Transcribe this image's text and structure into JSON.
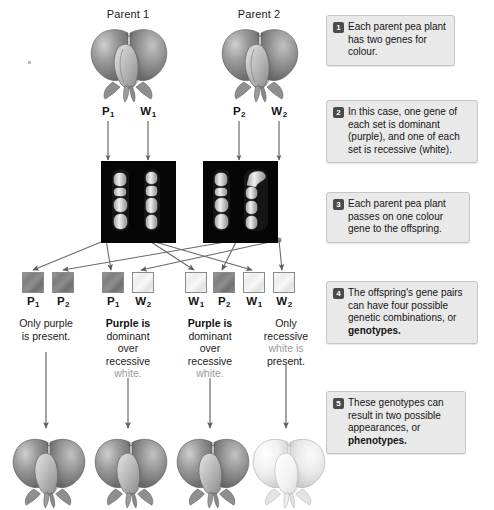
{
  "figure": {
    "background": "#ffffff"
  },
  "parents": [
    {
      "name": "Parent 1",
      "genes": [
        {
          "letter": "P",
          "sub": "1",
          "type": "purple"
        },
        {
          "letter": "W",
          "sub": "1",
          "type": "white"
        }
      ]
    },
    {
      "name": "Parent 2",
      "genes": [
        {
          "letter": "P",
          "sub": "2",
          "type": "purple"
        },
        {
          "letter": "W",
          "sub": "2",
          "type": "white"
        }
      ]
    }
  ],
  "chromosome_panels": [
    {
      "label": "Parent 1 chromosomes",
      "count": 2
    },
    {
      "label": "Parent 2 chromosomes",
      "count": 2
    }
  ],
  "offspring": [
    {
      "genes": [
        {
          "letter": "P",
          "sub": "1",
          "type": "purple"
        },
        {
          "letter": "P",
          "sub": "2",
          "type": "purple"
        }
      ],
      "description_parts": [
        {
          "text": "Only purple",
          "style": "normal"
        },
        {
          "text": "is present.",
          "style": "normal"
        }
      ],
      "phenotype": "purple"
    },
    {
      "genes": [
        {
          "letter": "P",
          "sub": "1",
          "type": "purple"
        },
        {
          "letter": "W",
          "sub": "2",
          "type": "white"
        }
      ],
      "description_parts": [
        {
          "text": "Purple is",
          "style": "bold"
        },
        {
          "text": "dominant",
          "style": "normal"
        },
        {
          "text": "over",
          "style": "normal"
        },
        {
          "text": "recessive",
          "style": "normal"
        },
        {
          "text": "white.",
          "style": "grey"
        }
      ],
      "phenotype": "purple"
    },
    {
      "genes": [
        {
          "letter": "W",
          "sub": "1",
          "type": "white"
        },
        {
          "letter": "P",
          "sub": "2",
          "type": "purple"
        }
      ],
      "description_parts": [
        {
          "text": "Purple is",
          "style": "bold"
        },
        {
          "text": "dominant",
          "style": "normal"
        },
        {
          "text": "over",
          "style": "normal"
        },
        {
          "text": "recessive",
          "style": "normal"
        },
        {
          "text": "white.",
          "style": "grey"
        }
      ],
      "phenotype": "purple"
    },
    {
      "genes": [
        {
          "letter": "W",
          "sub": "1",
          "type": "white"
        },
        {
          "letter": "W",
          "sub": "2",
          "type": "white"
        }
      ],
      "description_parts": [
        {
          "text": "Only",
          "style": "normal"
        },
        {
          "text": "recessive",
          "style": "normal"
        },
        {
          "text": "white is",
          "style": "grey"
        },
        {
          "text": "present.",
          "style": "normal"
        }
      ],
      "phenotype": "white"
    }
  ],
  "callouts": [
    {
      "number": "1",
      "text": "Each parent pea plant has two genes for colour."
    },
    {
      "number": "2",
      "text": "In this case, one gene of each set is dominant (purple), and one of each set is recessive (white)."
    },
    {
      "number": "3",
      "text": "Each parent pea plant passes on one colour gene to the offspring."
    },
    {
      "number": "4",
      "text": "The offspring's gene pairs can have four possible genetic combinations, or ",
      "bold_tail": "genotypes."
    },
    {
      "number": "5",
      "text": "These genotypes can result in two possible appearances, or ",
      "bold_tail": "phenotypes."
    }
  ],
  "colors": {
    "purple_gene": "#7d7d7d",
    "white_gene": "#f0f0f0",
    "callout_bg": "#e9e9e9",
    "badge_bg": "#4a4a4a",
    "arrow": "#5d5d5d"
  }
}
